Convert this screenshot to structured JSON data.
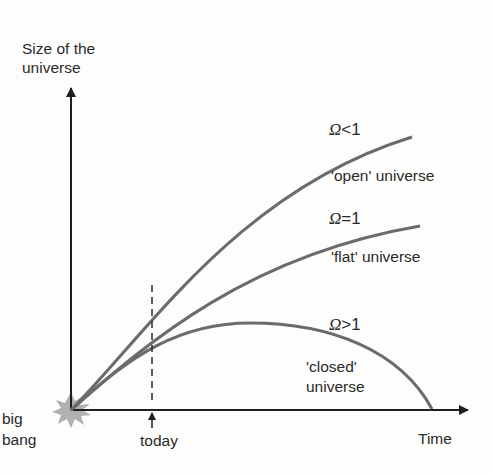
{
  "axes": {
    "y_label_line1": "Size of the",
    "y_label_line2": "universe",
    "x_label": "Time"
  },
  "markers": {
    "origin_line1": "big",
    "origin_line2": "bang",
    "today": "today"
  },
  "curves": [
    {
      "symbol": "Ω",
      "relation": "<",
      "value": "1",
      "name": "'open' universe"
    },
    {
      "symbol": "Ω",
      "relation": "=",
      "value": "1",
      "name": "'flat' universe"
    },
    {
      "symbol": "Ω",
      "relation": ">",
      "value": "1",
      "name_line1": "'closed'",
      "name_line2": "universe"
    }
  ],
  "colors": {
    "curve": "#6b6b6b",
    "axis": "#1e1e1e",
    "starburst": "#9a9a9a",
    "text": "#2a2a2a"
  }
}
